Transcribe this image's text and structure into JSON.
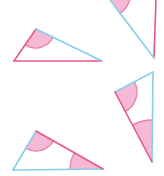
{
  "page": {
    "width": 164,
    "height": 176,
    "background": "#ffffff"
  },
  "colors": {
    "pink_stroke": "#e8568a",
    "blue_stroke": "#87ceea",
    "angle_fill": "#f6b9d5",
    "angle_arc": "#e981ad"
  },
  "figure": {
    "stroke_width": 1.6,
    "arc_stroke_width": 1.3,
    "triangles": [
      {
        "id": "top-left",
        "vertices": {
          "A": [
            36,
            29
          ],
          "B": [
            14,
            61
          ],
          "C": [
            102,
            61
          ]
        },
        "edges": [
          {
            "from": "A",
            "to": "B",
            "color": "pink"
          },
          {
            "from": "B",
            "to": "C",
            "color": "pink"
          },
          {
            "from": "A",
            "to": "C",
            "color": "blue"
          }
        ],
        "angle_markers": [
          {
            "at": "A",
            "toward": [
              "B",
              "C"
            ],
            "radius": 19
          }
        ]
      },
      {
        "id": "top-right-clipped",
        "vertices": {
          "A": [
            104,
            -8
          ],
          "B": [
            157,
            -30
          ],
          "C": [
            154,
            58
          ]
        },
        "edges": [
          {
            "from": "A",
            "to": "B",
            "color": "pink"
          },
          {
            "from": "B",
            "to": "C",
            "color": "pink"
          },
          {
            "from": "A",
            "to": "C",
            "color": "blue"
          }
        ],
        "angle_markers": [
          {
            "at": "A",
            "toward": [
              "B",
              "C"
            ],
            "radius": 27
          }
        ]
      },
      {
        "id": "bottom-right-clipped",
        "vertices": {
          "A": [
            153,
            72
          ],
          "B": [
            115,
            92
          ],
          "C": [
            152,
            162
          ]
        },
        "edges": [
          {
            "from": "B",
            "to": "A",
            "color": "blue"
          },
          {
            "from": "A",
            "to": "C",
            "color": "blue"
          },
          {
            "from": "B",
            "to": "C",
            "color": "pink"
          }
        ],
        "angle_markers": [
          {
            "at": "B",
            "toward": [
              "A",
              "C"
            ],
            "radius": 22
          },
          {
            "at": "C",
            "toward": [
              "B",
              "A"
            ],
            "radius": 42
          }
        ]
      },
      {
        "id": "bottom-left",
        "vertices": {
          "A": [
            36,
            131
          ],
          "B": [
            13,
            170
          ],
          "C": [
            103,
            169
          ]
        },
        "edges": [
          {
            "from": "A",
            "to": "B",
            "color": "blue"
          },
          {
            "from": "B",
            "to": "C",
            "color": "blue"
          },
          {
            "from": "A",
            "to": "C",
            "color": "pink"
          }
        ],
        "angle_markers": [
          {
            "at": "A",
            "toward": [
              "B",
              "C"
            ],
            "radius": 20
          },
          {
            "at": "C",
            "toward": [
              "A",
              "B"
            ],
            "radius": 33
          }
        ]
      }
    ]
  }
}
